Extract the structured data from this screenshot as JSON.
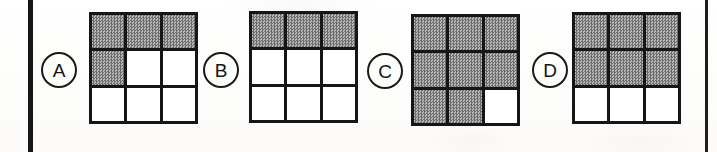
{
  "page": {
    "background_color": "#fdfdfc",
    "width": 717,
    "height": 152
  },
  "rules": {
    "left_rule_label": "left-margin-rule",
    "left_rule_color": "#161616",
    "right_rule_label": "right-margin-rule",
    "right_rule_color": "#1d1d1d"
  },
  "legend": {
    "filled_color": "#8e8e8e",
    "empty_color": "#ffffff",
    "border_color": "#161616",
    "fill_style": "halftone-checker"
  },
  "options": [
    {
      "letter": "A",
      "circle_x": 41,
      "circle_y": 52,
      "grid_x": 89,
      "grid_y": 12,
      "filled_count": 4,
      "cells": [
        [
          1,
          1,
          1
        ],
        [
          1,
          0,
          0
        ],
        [
          0,
          0,
          0
        ]
      ]
    },
    {
      "letter": "B",
      "circle_x": 203,
      "circle_y": 52,
      "grid_x": 249,
      "grid_y": 11,
      "filled_count": 3,
      "cells": [
        [
          1,
          1,
          1
        ],
        [
          0,
          0,
          0
        ],
        [
          0,
          0,
          0
        ]
      ]
    },
    {
      "letter": "C",
      "circle_x": 367,
      "circle_y": 53,
      "grid_x": 411,
      "grid_y": 14,
      "filled_count": 8,
      "cells": [
        [
          1,
          1,
          1
        ],
        [
          1,
          1,
          1
        ],
        [
          1,
          1,
          0
        ]
      ]
    },
    {
      "letter": "D",
      "circle_x": 532,
      "circle_y": 52,
      "grid_x": 572,
      "grid_y": 12,
      "filled_count": 6,
      "cells": [
        [
          1,
          1,
          1
        ],
        [
          1,
          1,
          1
        ],
        [
          0,
          0,
          0
        ]
      ]
    }
  ]
}
